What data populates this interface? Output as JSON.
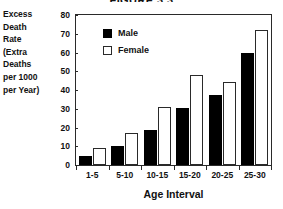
{
  "chart_data": {
    "type": "bar",
    "title": "FIGURE 3.3",
    "title_truncated": true,
    "categories": [
      "1-5",
      "5-10",
      "10-15",
      "15-20",
      "20-25",
      "25-30"
    ],
    "series": [
      {
        "name": "Male",
        "values": [
          5,
          10,
          18.5,
          30.5,
          37.5,
          60
        ],
        "color": "#000000"
      },
      {
        "name": "Female",
        "values": [
          9,
          17,
          31,
          48,
          44.5,
          72
        ],
        "color": "#ffffff"
      }
    ],
    "xlabel": "Age Interval",
    "ylabel": "Excess Death Rate (Extra Deaths per 1000 per Year)",
    "ylabel_lines": [
      "Excess",
      "Death",
      "Rate",
      "(Extra",
      "Deaths",
      "per 1000",
      "per Year)"
    ],
    "ylim": [
      0,
      80
    ],
    "yticks": [
      0,
      10,
      20,
      30,
      40,
      50,
      60,
      70,
      80
    ],
    "grid": false,
    "legend_position": "upper-left-inside",
    "frame_color": "#2a2a2a"
  }
}
